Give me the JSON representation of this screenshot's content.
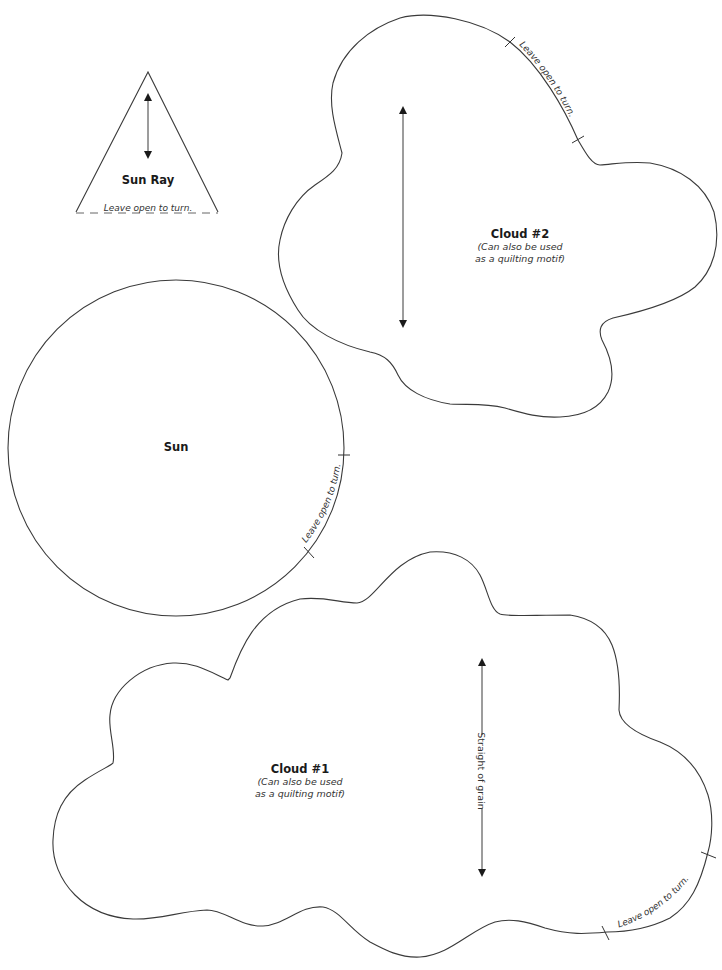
{
  "colors": {
    "line": "#3a3a3a",
    "text": "#1a1a1a",
    "background": "#ffffff"
  },
  "pieces": {
    "sun_ray": {
      "title": "Sun Ray",
      "note": "Leave open to turn.",
      "grain_icon": "double-arrow-icon"
    },
    "cloud2": {
      "title": "Cloud #2",
      "sub_line1": "(Can also be used",
      "sub_line2": "as a quilting motif)",
      "note": "Leave open to turn.",
      "grain_icon": "double-arrow-icon"
    },
    "sun": {
      "title": "Sun",
      "note": "Leave open to turn."
    },
    "cloud1": {
      "title": "Cloud #1",
      "sub_line1": "(Can also be used",
      "sub_line2": "as a quilting motif)",
      "grain_label": "Straight of grain",
      "note": "Leave open to turn.",
      "grain_icon": "double-arrow-icon"
    }
  }
}
